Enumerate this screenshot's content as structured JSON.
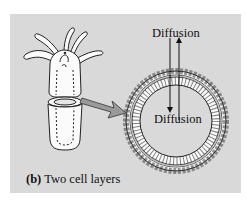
{
  "figure": {
    "panel_color": "#d9d9d9",
    "labels": {
      "diffusion_top": "Diffusion",
      "diffusion_bottom": "Diffusion"
    },
    "caption": {
      "letter": "(b)",
      "text": " Two cell layers"
    },
    "elements": [
      "hydra-organism",
      "cross-section-ring-two-cell-layers",
      "pointer-arrow",
      "diffusion-arrows-in-out"
    ]
  }
}
